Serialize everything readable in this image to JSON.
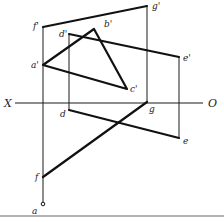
{
  "diagram": {
    "title": "",
    "axis": {
      "left_label": "X",
      "right_label": "O",
      "y": 103,
      "x1": 15,
      "x2": 203
    },
    "points": {
      "f_prime": {
        "label": "f'",
        "x": 43,
        "y": 27
      },
      "g_prime": {
        "label": "g'",
        "x": 147,
        "y": 6
      },
      "a_prime": {
        "label": "a'",
        "x": 43,
        "y": 65
      },
      "b_prime": {
        "label": "b'",
        "x": 94,
        "y": 29
      },
      "c_prime": {
        "label": "c'",
        "x": 127,
        "y": 89
      },
      "d_prime": {
        "label": "d'",
        "x": 69,
        "y": 34
      },
      "e_prime": {
        "label": "e'",
        "x": 179,
        "y": 57
      },
      "d": {
        "label": "d",
        "x": 69,
        "y": 110
      },
      "e": {
        "label": "e",
        "x": 179,
        "y": 138
      },
      "g": {
        "label": "g",
        "x": 147,
        "y": 103
      },
      "f": {
        "label": "f",
        "x": 43,
        "y": 177
      },
      "a": {
        "label": "a",
        "x": 43,
        "y": 204
      }
    },
    "thick_segments": [
      [
        "f_prime",
        "g_prime"
      ],
      [
        "a_prime",
        "b_prime"
      ],
      [
        "b_prime",
        "c_prime"
      ],
      [
        "c_prime",
        "a_prime"
      ],
      [
        "d_prime",
        "e_prime"
      ],
      [
        "d",
        "e"
      ],
      [
        "f",
        "g"
      ]
    ],
    "thin_segments": [
      [
        "f_prime",
        "a"
      ],
      [
        "g_prime",
        "g"
      ],
      [
        "d_prime",
        "d"
      ],
      [
        "e_prime",
        "e"
      ]
    ]
  }
}
